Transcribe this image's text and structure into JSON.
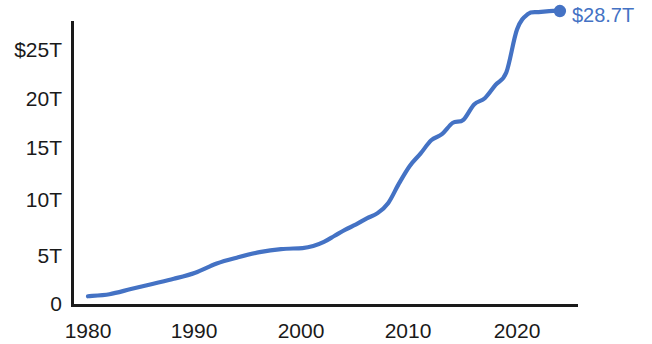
{
  "chart_data": {
    "type": "line",
    "title": "",
    "subtitle": "",
    "xlabel": "",
    "ylabel": "",
    "xlim": [
      1980,
      2024
    ],
    "ylim": [
      0,
      29.5
    ],
    "grid": false,
    "legend": null,
    "x_tick_labels": [
      "1980",
      "1990",
      "2000",
      "2010",
      "2020"
    ],
    "x_tick_values": [
      1980,
      1990,
      2000,
      2010,
      2020
    ],
    "y_tick_labels": [
      "$25T",
      "20T",
      "15T",
      "10T",
      "5T",
      "0"
    ],
    "y_tick_values": [
      25,
      20,
      15,
      10,
      5,
      0
    ],
    "series": [
      {
        "name": "Total",
        "color": "#4472c4",
        "x": [
          1980,
          1982,
          1984,
          1986,
          1988,
          1990,
          1992,
          1994,
          1996,
          1998,
          2000,
          2001,
          2002,
          2003,
          2004,
          2005,
          2006,
          2007,
          2008,
          2009,
          2010,
          2011,
          2012,
          2013,
          2014,
          2015,
          2016,
          2017,
          2018,
          2019,
          2020,
          2021,
          2022,
          2023,
          2024
        ],
        "values": [
          0.9,
          1.1,
          1.6,
          2.1,
          2.6,
          3.2,
          4.1,
          4.7,
          5.2,
          5.5,
          5.6,
          5.8,
          6.2,
          6.8,
          7.4,
          7.9,
          8.5,
          9.0,
          10.0,
          11.9,
          13.6,
          14.8,
          16.1,
          16.7,
          17.8,
          18.1,
          19.6,
          20.2,
          21.5,
          22.7,
          26.9,
          28.4,
          28.6,
          28.7,
          28.7
        ]
      }
    ],
    "annotations": [
      {
        "name": "endpoint-value",
        "text": "$28.7T",
        "value": 28.7,
        "x": 2024,
        "color": "#4472c4",
        "marker": "dot"
      }
    ],
    "axis_color": "#1a1a1a",
    "background_color": "#ffffff"
  }
}
